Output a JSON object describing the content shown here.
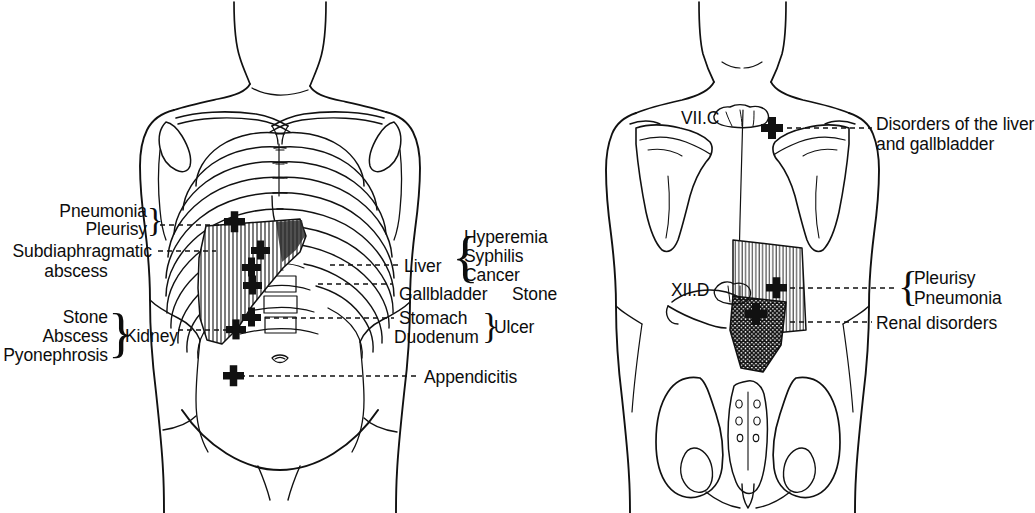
{
  "diagram": {
    "views": [
      {
        "name": "anterior-view",
        "label": ""
      },
      {
        "name": "posterior-view",
        "label": ""
      }
    ],
    "ink_color": "#111111",
    "paper_color": "#ffffff"
  },
  "anterior": {
    "left_labels": [
      {
        "id": "pneumonia",
        "text": "Pneumonia"
      },
      {
        "id": "pleurisy",
        "text": "Pleurisy"
      },
      {
        "id": "subdiaphragmatic",
        "text": "Subdiaphragmatic"
      },
      {
        "id": "abscess",
        "text": "abscess"
      },
      {
        "id": "stone",
        "text": "Stone"
      },
      {
        "id": "abscess2",
        "text": "Abscess"
      },
      {
        "id": "pyonephrosis",
        "text": "Pyonephrosis"
      },
      {
        "id": "kidney",
        "text": "Kidney"
      }
    ],
    "right_labels": [
      {
        "id": "hyperemia",
        "text": "Hyperemia"
      },
      {
        "id": "syphilis",
        "text": "Syphilis"
      },
      {
        "id": "cancer",
        "text": "Cancer"
      },
      {
        "id": "liver",
        "text": "Liver"
      },
      {
        "id": "gallbladder",
        "text": "Gallbladder"
      },
      {
        "id": "gallstone",
        "text": "Stone"
      },
      {
        "id": "stomach",
        "text": "Stomach"
      },
      {
        "id": "duodenum",
        "text": "Duodenum"
      },
      {
        "id": "ulcer",
        "text": "Ulcer"
      },
      {
        "id": "appendicitis",
        "text": "Appendicitis"
      }
    ]
  },
  "posterior": {
    "vertebra_labels": [
      {
        "id": "c7",
        "text": "VII.C"
      },
      {
        "id": "t12",
        "text": "XII.D"
      }
    ],
    "right_labels": [
      {
        "id": "liver-gallbladder-1",
        "text": "Disorders of the liver"
      },
      {
        "id": "liver-gallbladder-2",
        "text": "and gallbladder"
      },
      {
        "id": "pleurisy",
        "text": "Pleurisy"
      },
      {
        "id": "pneumonia",
        "text": "Pneumonia"
      },
      {
        "id": "renal",
        "text": "Renal disorders"
      }
    ]
  }
}
